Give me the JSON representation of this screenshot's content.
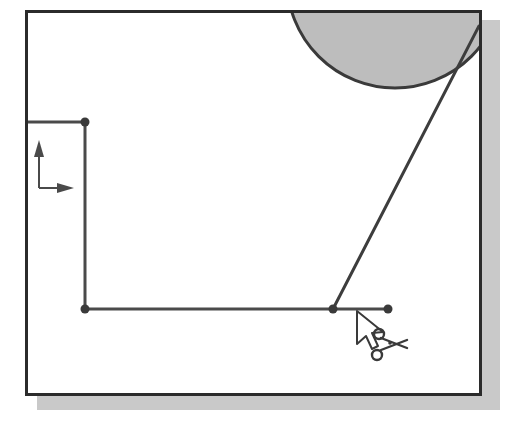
{
  "illustration": {
    "kind": "cad-sketch-figure",
    "description": "CAD sketch window showing partial circle, polyline geometry with snap nodes, coordinate-axis indicator and a trim (scissors) cursor",
    "background_color": "#ffffff",
    "line_color": "#404040",
    "frame_color": "#2b2b2b",
    "shadow_color": "#c9c9c9",
    "circle_fill_color": "#bdbdbd",
    "node_color": "#3a3a3a",
    "cursor_fill_color": "#ffffff"
  },
  "frame": {
    "name": "drawing-window",
    "x": 25,
    "y": 10,
    "width": 457,
    "height": 386,
    "border_width": 3,
    "shadow_offset_x": 12,
    "shadow_offset_y": 10
  },
  "geometry": {
    "circle": {
      "name": "shaded-circle",
      "center_x": 395,
      "center_y": -20,
      "radius": 108,
      "fill": "#bdbdbd",
      "stroke": "#3a3a3a",
      "stroke_width": 3
    },
    "polyline": {
      "name": "sketch-polyline",
      "points": [
        {
          "x": 27,
          "y": 122
        },
        {
          "x": 85,
          "y": 122
        },
        {
          "x": 85,
          "y": 309
        },
        {
          "x": 333,
          "y": 309
        },
        {
          "x": 388,
          "y": 309
        }
      ],
      "stroke": "#484848",
      "stroke_width": 3
    },
    "diagonal_line": {
      "name": "diagonal-edge",
      "x1": 333,
      "y1": 309,
      "x2": 479,
      "y2": 26,
      "stroke": "#3d3d3d",
      "stroke_width": 3
    },
    "nodes": [
      {
        "name": "node-top-left",
        "x": 85,
        "y": 122,
        "r": 4
      },
      {
        "name": "node-corner",
        "x": 85,
        "y": 309,
        "r": 4
      },
      {
        "name": "node-junction",
        "x": 333,
        "y": 309,
        "r": 4
      },
      {
        "name": "node-end-right",
        "x": 388,
        "y": 309,
        "r": 4
      }
    ]
  },
  "axes_indicator": {
    "name": "coordinate-axes-icon",
    "origin_x": 39,
    "origin_y": 188,
    "y_tip_y": 141,
    "x_tip_x": 73,
    "stroke": "#4a4a4a",
    "stroke_width": 2
  },
  "cursor": {
    "name": "trim-scissors-cursor",
    "pointer_tip_x": 357,
    "pointer_tip_y": 311,
    "scissors_x": 381,
    "scissors_y": 332,
    "stroke": "#3a3a3a",
    "fill": "#ffffff"
  }
}
